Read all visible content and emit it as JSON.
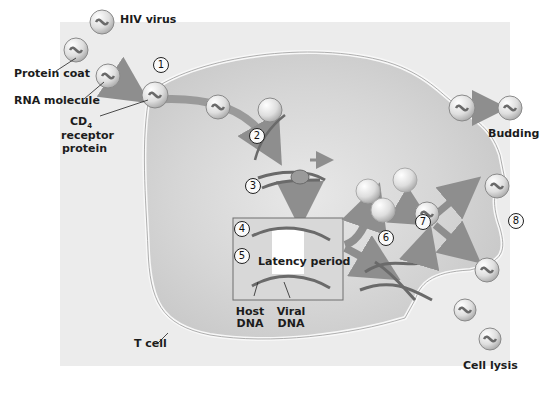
{
  "diagram": {
    "colors": {
      "panel_background": "#ebebeb",
      "cell_interior": "#d9d9d9",
      "membrane": "#f4f4f4",
      "arrow": "#8e8e8e",
      "virus_shell": "#dcdcdc",
      "rna": "#6a6a6a",
      "text": "#1c1c1c"
    },
    "labels": {
      "hiv_virus": "HIV virus",
      "protein_coat": "Protein coat",
      "rna_molecule": "RNA molecule",
      "cd4_main": "CD",
      "cd4_sub": "4",
      "receptor": "receptor",
      "protein": "protein",
      "budding": "Budding",
      "latency_period": "Latency period",
      "host": "Host",
      "host_dna": "DNA",
      "viral": "Viral",
      "viral_dna": "DNA",
      "t_cell": "T cell",
      "cell_lysis": "Cell lysis"
    },
    "steps": [
      "1",
      "2",
      "3",
      "4",
      "5",
      "6",
      "7",
      "8"
    ]
  }
}
